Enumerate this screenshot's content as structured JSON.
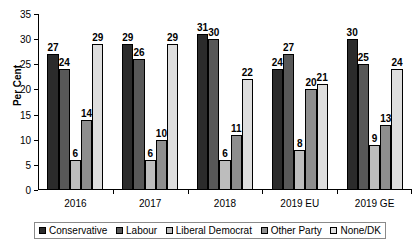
{
  "chart_data": {
    "type": "bar",
    "title": "",
    "xlabel": "",
    "ylabel": "Per Cent",
    "ylim": [
      0,
      35
    ],
    "yticks": [
      0,
      5,
      10,
      15,
      20,
      25,
      30,
      35
    ],
    "grid": false,
    "legend_position": "bottom",
    "categories": [
      "2016",
      "2017",
      "2018",
      "2019 EU",
      "2019 GE"
    ],
    "series": [
      {
        "name": "Conservative",
        "color": "#2b2b2b",
        "values": [
          27,
          29,
          31,
          24,
          30
        ]
      },
      {
        "name": "Labour",
        "color": "#585858",
        "values": [
          24,
          26,
          30,
          27,
          25
        ]
      },
      {
        "name": "Liberal Democrat",
        "color": "#bdbdbd",
        "values": [
          6,
          6,
          6,
          8,
          9
        ]
      },
      {
        "name": "Other Party",
        "color": "#8e8e8e",
        "values": [
          14,
          10,
          11,
          20,
          13
        ]
      },
      {
        "name": "None/DK",
        "color": "#dedede",
        "values": [
          29,
          29,
          22,
          21,
          24
        ]
      }
    ]
  },
  "axis": {
    "y_title": "Per Cent",
    "y_tick_labels": [
      "0",
      "5",
      "10",
      "15",
      "20",
      "25",
      "30",
      "35"
    ]
  },
  "legend": {
    "items": [
      {
        "label": "Conservative",
        "color": "#2b2b2b"
      },
      {
        "label": "Labour",
        "color": "#585858"
      },
      {
        "label": "Liberal Democrat",
        "color": "#bdbdbd"
      },
      {
        "label": "Other Party",
        "color": "#8e8e8e"
      },
      {
        "label": "None/DK",
        "color": "#dedede"
      }
    ]
  }
}
